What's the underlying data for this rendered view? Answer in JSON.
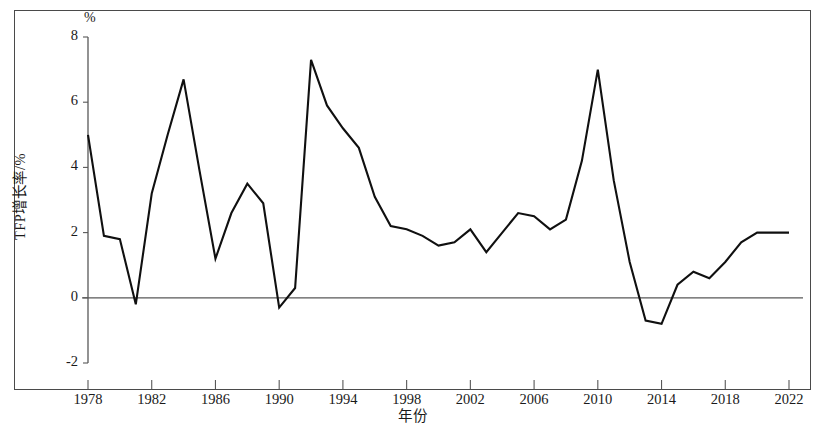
{
  "figure": {
    "unit_note": "%",
    "frame": true,
    "line_color": "#101010",
    "axis_color": "#585858"
  },
  "chart_data": {
    "type": "line",
    "title": "",
    "subtitle": "",
    "xlabel": "年份",
    "ylabel": "TFP增长率/%",
    "unit_note": "%",
    "xlim": [
      1978,
      2022
    ],
    "ylim": [
      -2,
      8
    ],
    "ytick_labels": [
      "8",
      "6",
      "4",
      "2",
      "0",
      "-2"
    ],
    "yticks": [
      8,
      6,
      4,
      2,
      0,
      -2
    ],
    "xtick_labels": [
      "1978",
      "1982",
      "1986",
      "1990",
      "1994",
      "1998",
      "2002",
      "2006",
      "2010",
      "2014",
      "2018",
      "2022"
    ],
    "xticks": [
      1978,
      1982,
      1986,
      1990,
      1994,
      1998,
      2002,
      2006,
      2010,
      2014,
      2018,
      2022
    ],
    "grid": false,
    "zero_line": true,
    "legend": null,
    "legend_position": "none",
    "series": [
      {
        "name": "TFP增长率",
        "x": [
          1978,
          1979,
          1980,
          1981,
          1982,
          1983,
          1984,
          1985,
          1986,
          1987,
          1988,
          1989,
          1990,
          1991,
          1992,
          1993,
          1994,
          1995,
          1996,
          1997,
          1998,
          1999,
          2000,
          2001,
          2002,
          2003,
          2004,
          2005,
          2006,
          2007,
          2008,
          2009,
          2010,
          2011,
          2012,
          2013,
          2014,
          2015,
          2016,
          2017,
          2018,
          2019,
          2020,
          2021,
          2022
        ],
        "values": [
          5.0,
          1.9,
          1.8,
          -0.2,
          3.2,
          5.0,
          6.7,
          3.9,
          1.2,
          2.6,
          3.5,
          2.9,
          -0.3,
          0.3,
          7.3,
          5.9,
          5.2,
          4.6,
          3.1,
          2.2,
          2.1,
          1.9,
          1.6,
          1.7,
          2.1,
          1.4,
          2.0,
          2.6,
          2.5,
          2.1,
          2.4,
          4.2,
          7.0,
          3.6,
          1.1,
          -0.7,
          -0.8,
          0.4,
          0.8,
          0.6,
          1.1,
          1.7,
          2.0,
          2.0,
          2.0
        ]
      }
    ],
    "annotations": [
      {
        "label": "1978 start",
        "x": 1978,
        "y": 5.0
      },
      {
        "label": "1992 peak",
        "x": 1992,
        "y": 7.3
      },
      {
        "label": "2007 peak",
        "x": 2007,
        "y": 7.0
      },
      {
        "label": "2020 trough",
        "x": 2020,
        "y": -1.1
      },
      {
        "label": "2021 rebound",
        "x": 2021,
        "y": 4.4
      },
      {
        "label": "2022 end",
        "x": 2022,
        "y": 0.6
      }
    ],
    "points": [
      [
        1978,
        5.0
      ],
      [
        1979,
        1.9
      ],
      [
        1980,
        1.8
      ],
      [
        1981,
        -0.2
      ],
      [
        1982,
        3.2
      ],
      [
        1983,
        5.0
      ],
      [
        1984,
        6.7
      ],
      [
        1985,
        3.9
      ],
      [
        1986,
        1.2
      ],
      [
        1987,
        2.6
      ],
      [
        1988,
        3.5
      ],
      [
        1989,
        2.9
      ],
      [
        1990,
        -0.3
      ],
      [
        1991,
        0.3
      ],
      [
        1992,
        7.3
      ],
      [
        1993,
        5.9
      ],
      [
        1994,
        5.2
      ],
      [
        1995,
        4.6
      ],
      [
        1996,
        3.1
      ],
      [
        1997,
        2.2
      ],
      [
        1998,
        2.1
      ],
      [
        1999,
        1.9
      ],
      [
        2000,
        1.6
      ],
      [
        2001,
        1.7
      ],
      [
        2002,
        2.1
      ],
      [
        2003,
        1.4
      ],
      [
        2004,
        2.0
      ],
      [
        2005,
        2.6
      ],
      [
        2006,
        2.5
      ],
      [
        2007,
        2.1
      ],
      [
        2008,
        2.4
      ],
      [
        2009,
        4.2
      ],
      [
        2010,
        7.0
      ],
      [
        2011,
        3.6
      ],
      [
        2012,
        1.1
      ],
      [
        2013,
        -0.7
      ],
      [
        2014,
        -0.8
      ],
      [
        2015,
        0.4
      ],
      [
        2016,
        0.8
      ],
      [
        2017,
        0.6
      ],
      [
        2018,
        1.1
      ],
      [
        2019,
        1.7
      ],
      [
        2020,
        2.0
      ],
      [
        2021,
        2.0
      ],
      [
        2022,
        2.0
      ]
    ]
  }
}
